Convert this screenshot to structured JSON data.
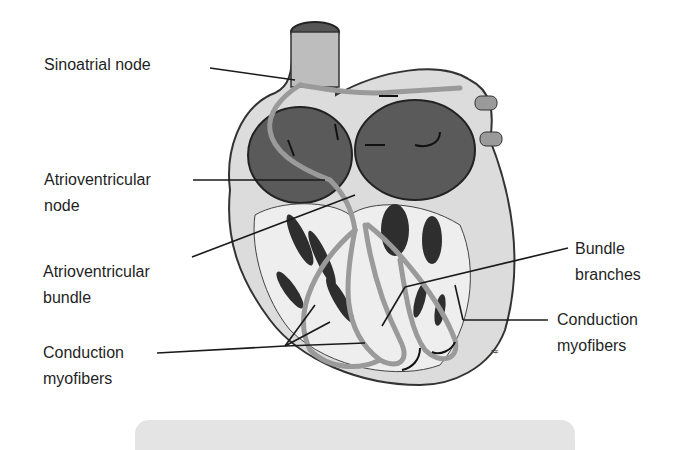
{
  "diagram": {
    "labels": {
      "sinoatrial_node": {
        "line1": "Sinoatrial node"
      },
      "atrioventricular_node": {
        "line1": "Atrioventricular",
        "line2": "node"
      },
      "atrioventricular_bundle": {
        "line1": "Atrioventricular",
        "line2": "bundle"
      },
      "conduction_myofibers_left": {
        "line1": "Conduction",
        "line2": "myofibers"
      },
      "bundle_branches": {
        "line1": "Bundle",
        "line2": "branches"
      },
      "conduction_myofibers_right": {
        "line1": "Conduction",
        "line2": "myofibers"
      }
    },
    "colors": {
      "background": "#ffffff",
      "label_text": "#1f1f1f",
      "leader_line": "#1a1a1a",
      "conduction_path": "#9a9a9a",
      "heart_wall": "#d9d9d9",
      "chamber_dark": "#4a4a4a",
      "caption_bar": "#e4e4e4"
    }
  }
}
